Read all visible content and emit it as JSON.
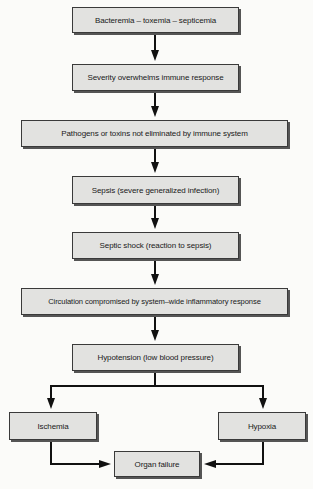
{
  "diagram": {
    "type": "flowchart",
    "colors": {
      "box_fill": "#e2e2e0",
      "border": "#3a3a3a",
      "arrow": "#111111",
      "background": "#fbfbf9"
    },
    "nodes": [
      {
        "id": "n1",
        "label": "Bacteremia – toxemia – septicemia"
      },
      {
        "id": "n2",
        "label": "Severity overwhelms immune response"
      },
      {
        "id": "n3",
        "label": "Pathogens or toxins not eliminated by immune system"
      },
      {
        "id": "n4",
        "label": "Sepsis (severe generalized infection)"
      },
      {
        "id": "n5",
        "label": "Septic shock (reaction to sepsis)"
      },
      {
        "id": "n6",
        "label": "Circulation compromised by system–wide inflammatory response"
      },
      {
        "id": "n7",
        "label": "Hypotension (low blood pressure)"
      },
      {
        "id": "n8",
        "label": "Ischemia"
      },
      {
        "id": "n9",
        "label": "Hypoxia"
      },
      {
        "id": "n10",
        "label": "Organ failure"
      }
    ],
    "edges": [
      [
        "n1",
        "n2"
      ],
      [
        "n2",
        "n3"
      ],
      [
        "n3",
        "n4"
      ],
      [
        "n4",
        "n5"
      ],
      [
        "n5",
        "n6"
      ],
      [
        "n6",
        "n7"
      ],
      [
        "n7",
        "n8"
      ],
      [
        "n7",
        "n9"
      ],
      [
        "n8",
        "n10"
      ],
      [
        "n9",
        "n10"
      ]
    ]
  }
}
